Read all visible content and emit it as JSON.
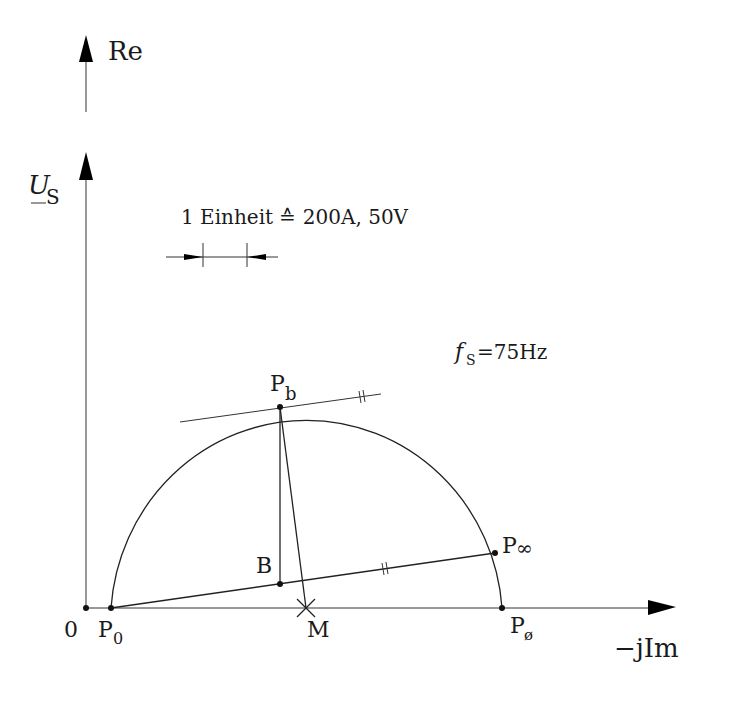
{
  "diagram": {
    "axes": {
      "re_label": "Re",
      "voltage_label_main": "U",
      "voltage_label_sub": "S",
      "im_label": "−jIm",
      "origin_label": "0"
    },
    "scale": {
      "label": "1 Einheit ≙ 200A, 50V"
    },
    "frequency": {
      "symbol": "f",
      "sub": "S",
      "value": "=75Hz"
    },
    "points": {
      "p0": {
        "main": "P",
        "sub": "0"
      },
      "pb": {
        "main": "P",
        "sub": "b"
      },
      "pinf": {
        "main": "P",
        "sub": "∞"
      },
      "pphi": {
        "main": "P",
        "sub": "ø"
      },
      "b": {
        "main": "B"
      },
      "m": {
        "main": "M"
      }
    },
    "marks": {
      "parallel_mark": "//"
    },
    "colors": {
      "stroke": "#222222",
      "background": "#ffffff"
    }
  }
}
